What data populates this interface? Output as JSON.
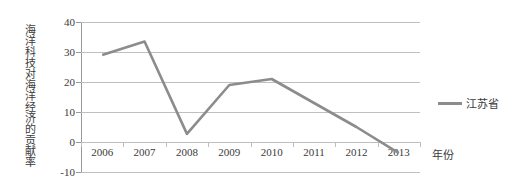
{
  "chart_data": {
    "type": "line",
    "title": "",
    "xlabel": "年份",
    "ylabel": "海洋科技对海洋经济的贡献率",
    "categories": [
      "2006",
      "2007",
      "2008",
      "2009",
      "2010",
      "2011",
      "2012",
      "2013"
    ],
    "series": [
      {
        "name": "江苏省",
        "color": "#8c8c8c",
        "values": [
          29.0,
          33.5,
          2.7,
          19.0,
          21.0,
          13.0,
          5.0,
          -3.7
        ]
      }
    ],
    "ylim": [
      -10,
      40
    ],
    "y_ticks": [
      "40",
      "30",
      "20",
      "10",
      "0",
      "-10"
    ],
    "y_tick_values": [
      40,
      30,
      20,
      10,
      0,
      -10
    ],
    "grid": true,
    "legend_position": "right"
  },
  "legend": {
    "entries": [
      {
        "label": "江苏省",
        "color": "#8c8c8c"
      }
    ]
  },
  "axes": {
    "y_title": "海洋科技对海洋经济的贡献率",
    "x_title": "年份"
  },
  "colors": {
    "series": "#8c8c8c",
    "grid": "#bfbfbf",
    "axis": "#9a9a9a",
    "text": "#3b3b3b",
    "background": "#ffffff"
  }
}
